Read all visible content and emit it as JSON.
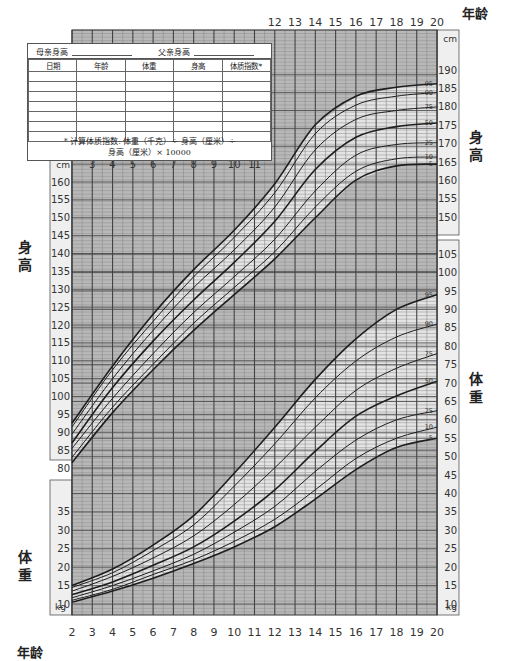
{
  "record_table": {
    "mother_height_label": "母亲身高",
    "father_height_label": "父亲身高",
    "columns": [
      "日期",
      "年龄",
      "体重",
      "身高",
      "体质指数*"
    ],
    "empty_rows": 7,
    "footnote_line1": "* 计算体质指数: 体重（千克）÷ 身高（厘米）÷",
    "footnote_line2": "身高（厘米）× 10000"
  },
  "labels": {
    "age_top": "年龄",
    "age_bottom": "年龄",
    "stature_left": "身高",
    "stature_right": "身高",
    "weight_left": "体重",
    "weight_right": "体重",
    "cm_unit": "cm",
    "kg_unit": "kg"
  },
  "chart_data": {
    "type": "line",
    "title": "",
    "xlabel": "年龄",
    "x_ticks": [
      2,
      3,
      4,
      5,
      6,
      7,
      8,
      9,
      10,
      11,
      12,
      13,
      14,
      15,
      16,
      17,
      18,
      19,
      20
    ],
    "x_ticks_top_visible": [
      12,
      13,
      14,
      15,
      16,
      17,
      18,
      19,
      20
    ],
    "x_ticks_inner_visible": [
      3,
      4,
      5,
      6,
      7,
      8,
      9,
      10,
      11
    ],
    "xlim": [
      2,
      20
    ],
    "grid": true,
    "percentiles": [
      5,
      10,
      25,
      50,
      75,
      90,
      95
    ],
    "panels": [
      {
        "name": "stature",
        "ylabel": "身高",
        "unit": "cm",
        "left_ticks": [
          80,
          85,
          90,
          95,
          100,
          105,
          110,
          115,
          120,
          125,
          130,
          135,
          140,
          145,
          150,
          155,
          160
        ],
        "right_ticks_upper": [
          150,
          155,
          160,
          165,
          170,
          175,
          180,
          185,
          190
        ],
        "ylim": [
          80,
          192
        ],
        "x": [
          2,
          4,
          6,
          8,
          10,
          12,
          14,
          16,
          18,
          20
        ],
        "series": [
          {
            "name": "5",
            "values": [
              81.5,
              95.5,
              107.5,
              118.5,
              128.5,
              138.5,
              150.0,
              160.5,
              164.5,
              165.0
            ]
          },
          {
            "name": "10",
            "values": [
              83.0,
              97.0,
              109.0,
              120.5,
              130.5,
              140.5,
              153.0,
              163.0,
              166.5,
              167.0
            ]
          },
          {
            "name": "25",
            "values": [
              85.5,
              99.5,
              112.0,
              123.5,
              133.5,
              144.0,
              157.5,
              167.5,
              170.5,
              171.0
            ]
          },
          {
            "name": "50",
            "values": [
              87.0,
              102.5,
              115.5,
              127.0,
              137.5,
              149.0,
              163.5,
              172.5,
              175.5,
              176.5
            ]
          },
          {
            "name": "75",
            "values": [
              89.5,
              105.0,
              118.5,
              130.5,
              141.0,
              153.0,
              169.0,
              177.5,
              180.0,
              181.0
            ]
          },
          {
            "name": "90",
            "values": [
              91.5,
              107.5,
              121.0,
              133.5,
              144.5,
              157.0,
              173.5,
              181.5,
              184.0,
              185.0
            ]
          },
          {
            "name": "95",
            "values": [
              92.5,
              108.5,
              123.0,
              135.5,
              146.5,
              159.5,
              176.0,
              184.0,
              186.5,
              187.5
            ]
          }
        ]
      },
      {
        "name": "weight",
        "ylabel": "体重",
        "unit": "kg",
        "left_ticks": [
          10,
          15,
          20,
          25,
          30,
          35
        ],
        "right_ticks": [
          10,
          15,
          20,
          25,
          30,
          35,
          40,
          45,
          50,
          55,
          60,
          65,
          70,
          75,
          80,
          85,
          90,
          95,
          100,
          105
        ],
        "ylim": [
          8,
          106
        ],
        "x": [
          2,
          4,
          6,
          8,
          10,
          12,
          14,
          16,
          18,
          20
        ],
        "series": [
          {
            "name": "5",
            "values": [
              10.5,
              13.5,
              17.0,
              21.0,
              25.5,
              31.0,
              38.5,
              46.5,
              52.5,
              55.0
            ]
          },
          {
            "name": "10",
            "values": [
              11.0,
              14.0,
              18.0,
              22.0,
              27.0,
              33.0,
              41.0,
              49.5,
              55.0,
              58.0
            ]
          },
          {
            "name": "25",
            "values": [
              11.7,
              15.0,
              19.0,
              23.5,
              29.5,
              36.5,
              46.0,
              54.5,
              60.0,
              62.5
            ]
          },
          {
            "name": "50",
            "values": [
              12.5,
              16.0,
              20.5,
              25.5,
              32.5,
              41.0,
              51.5,
              61.0,
              66.5,
              70.5
            ]
          },
          {
            "name": "75",
            "values": [
              13.5,
              17.5,
              22.5,
              28.5,
              37.0,
              47.0,
              58.0,
              68.0,
              74.0,
              78.0
            ]
          },
          {
            "name": "90",
            "values": [
              14.5,
              18.5,
              24.5,
              31.5,
              42.0,
              53.5,
              66.0,
              76.0,
              82.5,
              86.0
            ]
          },
          {
            "name": "95",
            "values": [
              15.0,
              19.5,
              26.0,
              34.0,
              45.5,
              58.0,
              71.0,
              82.0,
              90.0,
              94.0
            ]
          }
        ]
      }
    ]
  },
  "colors": {
    "grid_dark": "#444444",
    "grid_light": "#8c8c8c",
    "shade": "#b8b8b8",
    "band": "#e4e4e4",
    "curve": "#1e1e1e",
    "axis_box": "#efefef"
  }
}
